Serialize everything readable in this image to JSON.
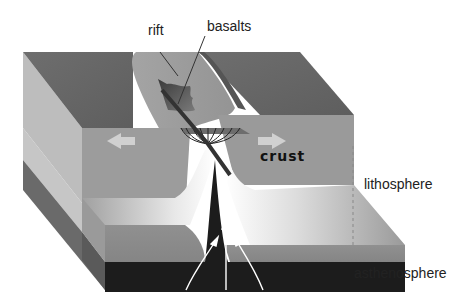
{
  "diagram": {
    "labels": {
      "rift": "rift",
      "basalts": "basalts",
      "crust": "crust",
      "lithosphere": "lithosphere",
      "asthenosphere": "asthenosphere"
    },
    "arrows": {
      "plate_motion": [
        "left",
        "right"
      ],
      "upwelling_count": 3
    },
    "colors": {
      "top_surface": "#6b6b6b",
      "rift_valley": "#9a9a9a",
      "crust_front": "#9c9c9c",
      "lithosphere_front": "#8a8a8a",
      "asthenosphere": "#1c1c1c",
      "side_light": "#b4b4b4"
    }
  }
}
